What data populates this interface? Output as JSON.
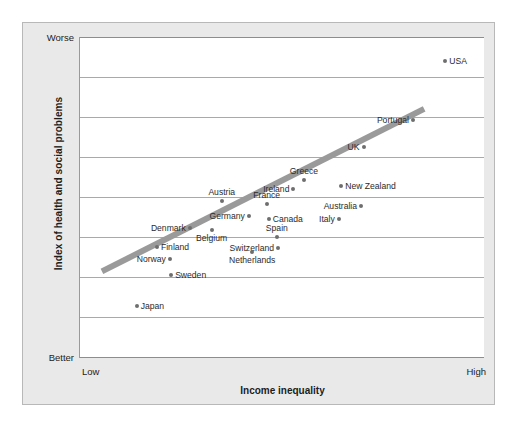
{
  "figure": {
    "background_color": "#e9e9e9",
    "plot_background_color": "#ffffff",
    "trendline_color": "#9a9a9a",
    "point_color": "#6e6e6e"
  },
  "chart_data": {
    "type": "scatter",
    "title": "",
    "xlabel": "Income inequality",
    "ylabel": "Index of health and social problems",
    "x_tick_labels": [
      "Low",
      "High"
    ],
    "y_tick_labels": [
      "Worse",
      "Better"
    ],
    "xlim": [
      "Low",
      "High"
    ],
    "ylim": [
      "Better",
      "Worse"
    ],
    "grid": "horizontal",
    "gridline_count": 9,
    "legend": "none",
    "annotations": [],
    "trendline": {
      "present": true,
      "description": "thick grey positive-slope fit line",
      "x_start_px": 100,
      "y_start_px": 271,
      "x_end_px": 423,
      "y_end_px": 108
    },
    "points": [
      {
        "label": "USA",
        "x": 0.902,
        "y": 0.924,
        "label_pos": "right"
      },
      {
        "label": "Portugal",
        "x": 0.822,
        "y": 0.74,
        "label_pos": "left"
      },
      {
        "label": "UK",
        "x": 0.7,
        "y": 0.656,
        "label_pos": "left"
      },
      {
        "label": "Greece",
        "x": 0.553,
        "y": 0.553,
        "label_pos": "above"
      },
      {
        "label": "New Zealand",
        "x": 0.645,
        "y": 0.537,
        "label_pos": "right"
      },
      {
        "label": "Ireland",
        "x": 0.527,
        "y": 0.528,
        "label_pos": "left"
      },
      {
        "label": "France",
        "x": 0.461,
        "y": 0.481,
        "label_pos": "above"
      },
      {
        "label": "Austria",
        "x": 0.35,
        "y": 0.49,
        "label_pos": "above"
      },
      {
        "label": "Australia",
        "x": 0.694,
        "y": 0.472,
        "label_pos": "left"
      },
      {
        "label": "Germany",
        "x": 0.417,
        "y": 0.441,
        "label_pos": "left"
      },
      {
        "label": "Canada",
        "x": 0.466,
        "y": 0.434,
        "label_pos": "right"
      },
      {
        "label": "Italy",
        "x": 0.639,
        "y": 0.434,
        "label_pos": "left"
      },
      {
        "label": "Denmark",
        "x": 0.271,
        "y": 0.406,
        "label_pos": "left"
      },
      {
        "label": "Belgium",
        "x": 0.325,
        "y": 0.4,
        "label_pos": "below"
      },
      {
        "label": "Spain",
        "x": 0.486,
        "y": 0.378,
        "label_pos": "above"
      },
      {
        "label": "Switzerland",
        "x": 0.489,
        "y": 0.344,
        "label_pos": "left"
      },
      {
        "label": "Netherlands",
        "x": 0.425,
        "y": 0.329,
        "label_pos": "below"
      },
      {
        "label": "Finland",
        "x": 0.19,
        "y": 0.347,
        "label_pos": "right"
      },
      {
        "label": "Norway",
        "x": 0.222,
        "y": 0.309,
        "label_pos": "left"
      },
      {
        "label": "Sweden",
        "x": 0.225,
        "y": 0.259,
        "label_pos": "right"
      },
      {
        "label": "Japan",
        "x": 0.14,
        "y": 0.163,
        "label_pos": "right"
      }
    ]
  }
}
